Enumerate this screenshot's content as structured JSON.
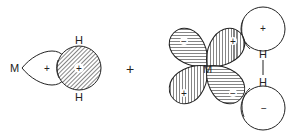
{
  "diagram": {
    "left_group": {
      "metal_label": "M",
      "lobe_sign": "+",
      "h_top_label": "H",
      "h_bottom_label": "H",
      "h_orbital_sign": "+"
    },
    "operator": "+",
    "right_group": {
      "metal_label": "M",
      "lobes": [
        {
          "position": "upper-left",
          "sign": "−"
        },
        {
          "position": "upper-right",
          "sign": "+"
        },
        {
          "position": "lower-left",
          "sign": "+"
        },
        {
          "position": "lower-right",
          "sign": "−"
        }
      ],
      "h_top_label": "H",
      "h_bottom_label": "H",
      "h_top_orbital_sign": "+",
      "h_bottom_orbital_sign": "−"
    },
    "colors": {
      "stroke": "#222222",
      "hatch": "#333333",
      "background": "#ffffff"
    }
  }
}
